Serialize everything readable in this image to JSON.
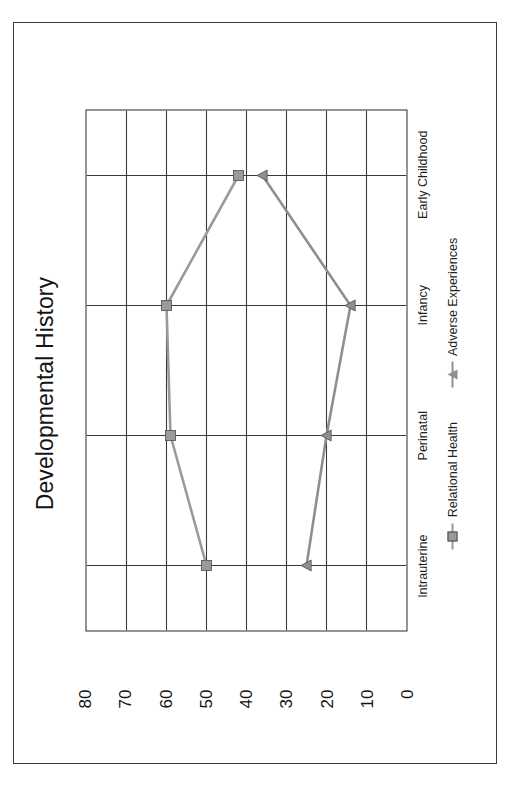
{
  "chart_data": {
    "type": "line",
    "title": "Developmental History",
    "xlabel": "",
    "ylabel": "",
    "categories": [
      "Intrauterine",
      "Perinatal",
      "Infancy",
      "Early Childhood"
    ],
    "series": [
      {
        "name": "Relational Health",
        "values": [
          50,
          59,
          60,
          42
        ],
        "color": "#9a9a9a",
        "marker": "square"
      },
      {
        "name": "Adverse Experiences",
        "values": [
          25,
          20,
          14,
          36
        ],
        "color": "#8f8f8f",
        "marker": "triangle"
      }
    ],
    "ylim": [
      0,
      80
    ],
    "yticks": [
      80,
      70,
      60,
      50,
      40,
      30,
      20,
      10,
      0
    ],
    "grid": true,
    "grid_axis": "both",
    "legend_position": "bottom",
    "rotation_degrees": -90
  },
  "figure": {
    "border_color": "#3b3b3b",
    "plot_border_color": "#2b2b2b",
    "grid_color": "#3a3a3a",
    "background": "#ffffff"
  }
}
